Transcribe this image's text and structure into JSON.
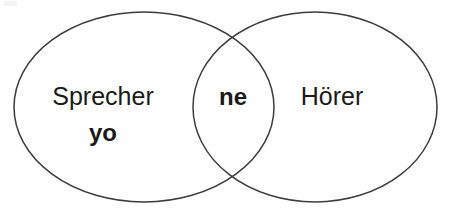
{
  "diagram": {
    "type": "venn",
    "background_color": "#ffffff",
    "stroke_color": "#3c3c3c",
    "text_color": "#1a1a1a",
    "sets": [
      {
        "id": "left",
        "name": "left-set",
        "label": "Sprecher",
        "sublabel": "yo",
        "cx": 144,
        "cy": 107,
        "rx": 130,
        "ry": 95
      },
      {
        "id": "right",
        "name": "right-set",
        "label": "Hörer",
        "sublabel": "",
        "cx": 315,
        "cy": 107,
        "rx": 122,
        "ry": 95
      }
    ],
    "intersection": {
      "name": "intersection",
      "label": "ne",
      "cx": 233,
      "cy": 105
    },
    "labels": {
      "left_primary": "Sprecher",
      "left_secondary": "yo",
      "center": "ne",
      "right_primary": "Hörer"
    }
  }
}
